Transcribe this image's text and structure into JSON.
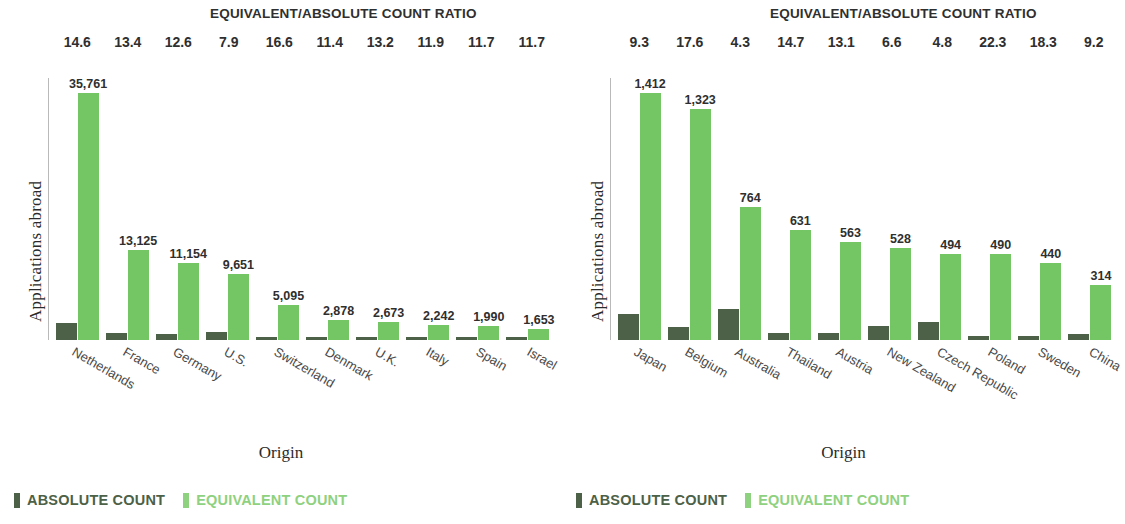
{
  "legend": {
    "absolute_label": "ABSOLUTE COUNT",
    "equivalent_label": "EQUIVALENT COUNT",
    "absolute_color": "#4c6147",
    "equivalent_color": "#8ed17f"
  },
  "panels": [
    {
      "ratio_title": "EQUIVALENT/ABSOLUTE COUNT RATIO",
      "ylabel": "Applications abroad",
      "xlabel": "Origin"
    },
    {
      "ratio_title": "EQUIVALENT/ABSOLUTE COUNT RATIO",
      "ylabel": "Applications abroad",
      "xlabel": "Origin"
    }
  ],
  "chart_data": [
    {
      "type": "bar",
      "title": "EQUIVALENT/ABSOLUTE COUNT RATIO",
      "xlabel": "Origin",
      "ylabel": "Applications abroad",
      "ylim": [
        0,
        38000
      ],
      "grid": false,
      "legend_position": "bottom-left",
      "categories": [
        "Netherlands",
        "France",
        "Germany",
        "U.S.",
        "Switzerland",
        "Denmark",
        "U.K.",
        "Italy",
        "Spain",
        "Israel"
      ],
      "ratios": [
        "14.6",
        "13.4",
        "12.6",
        "7.9",
        "16.6",
        "11.4",
        "13.2",
        "11.9",
        "11.7",
        "11.7"
      ],
      "series": [
        {
          "name": "ABSOLUTE COUNT",
          "color": "#4c6147",
          "values": [
            2449,
            980,
            885,
            1222,
            307,
            252,
            202,
            188,
            170,
            141
          ],
          "labels": [
            "",
            "",
            "",
            "",
            "",
            "",
            "",
            "",
            "",
            ""
          ]
        },
        {
          "name": "EQUIVALENT COUNT",
          "color": "#74c563",
          "values": [
            35761,
            13125,
            11154,
            9651,
            5095,
            2878,
            2673,
            2242,
            1990,
            1653
          ],
          "labels": [
            "35,761",
            "13,125",
            "11,154",
            "9,651",
            "5,095",
            "2,878",
            "2,673",
            "2,242",
            "1,990",
            "1,653"
          ]
        }
      ]
    },
    {
      "type": "bar",
      "title": "EQUIVALENT/ABSOLUTE COUNT RATIO",
      "xlabel": "Origin",
      "ylabel": "Applications abroad",
      "ylim": [
        0,
        1500
      ],
      "grid": false,
      "legend_position": "bottom-left",
      "categories": [
        "Japan",
        "Belgium",
        "Australia",
        "Thailand",
        "Austria",
        "New Zealand",
        "Czech Republic",
        "Poland",
        "Sweden",
        "China"
      ],
      "ratios": [
        "9.3",
        "17.6",
        "4.3",
        "14.7",
        "13.1",
        "6.6",
        "4.8",
        "22.3",
        "18.3",
        "9.2"
      ],
      "series": [
        {
          "name": "ABSOLUTE COUNT",
          "color": "#4c6147",
          "values": [
            152,
            75,
            178,
            43,
            43,
            80,
            103,
            22,
            24,
            34
          ],
          "labels": [
            "",
            "",
            "",
            "",
            "",
            "",
            "",
            "",
            "",
            ""
          ]
        },
        {
          "name": "EQUIVALENT COUNT",
          "color": "#74c563",
          "values": [
            1412,
            1323,
            764,
            631,
            563,
            528,
            494,
            490,
            440,
            314
          ],
          "labels": [
            "1,412",
            "1,323",
            "764",
            "631",
            "563",
            "528",
            "494",
            "490",
            "440",
            "314"
          ]
        }
      ]
    }
  ]
}
